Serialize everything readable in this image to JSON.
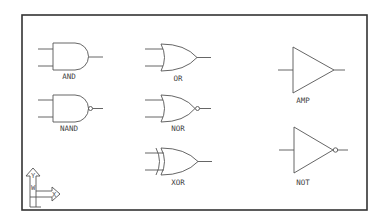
{
  "diagram": {
    "type": "logic-gate-symbol-library",
    "frame": {
      "border_color": "#333333",
      "background": "#ffffff"
    },
    "gates": [
      {
        "id": "and",
        "label": "AND",
        "symbol": "and-gate"
      },
      {
        "id": "nand",
        "label": "NAND",
        "symbol": "nand-gate"
      },
      {
        "id": "or",
        "label": "OR",
        "symbol": "or-gate"
      },
      {
        "id": "nor",
        "label": "NOR",
        "symbol": "nor-gate"
      },
      {
        "id": "xor",
        "label": "XOR",
        "symbol": "xor-gate"
      },
      {
        "id": "amp",
        "label": "AMP",
        "symbol": "buffer-amplifier"
      },
      {
        "id": "not",
        "label": "NOT",
        "symbol": "inverter"
      }
    ],
    "ucs_icon": {
      "x_label": "X",
      "y_label": "Y",
      "w_label": "W"
    },
    "line_color": "#555555"
  }
}
